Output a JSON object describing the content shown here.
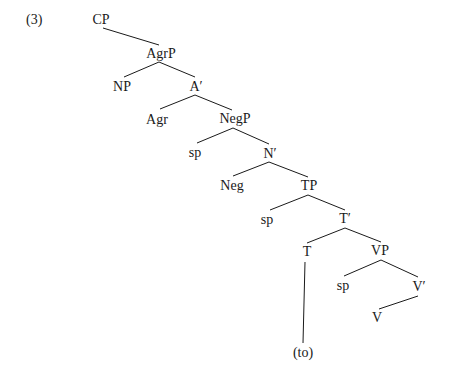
{
  "example_number": "(3)",
  "tree": {
    "nodes": {
      "cp": {
        "label": "CP",
        "x": 101,
        "y": 13
      },
      "agrp": {
        "label": "AgrP",
        "x": 161,
        "y": 47
      },
      "np": {
        "label": "NP",
        "x": 122,
        "y": 80
      },
      "a_bar": {
        "label": "A′",
        "x": 196,
        "y": 80
      },
      "agr": {
        "label": "Agr",
        "x": 157,
        "y": 113
      },
      "negp": {
        "label": "NegP",
        "x": 235,
        "y": 112
      },
      "sp1": {
        "label": "sp",
        "x": 195,
        "y": 146
      },
      "n_bar": {
        "label": "N′",
        "x": 270,
        "y": 147
      },
      "neg": {
        "label": "Neg",
        "x": 232,
        "y": 179
      },
      "tp": {
        "label": "TP",
        "x": 309,
        "y": 179
      },
      "sp2": {
        "label": "sp",
        "x": 267,
        "y": 213
      },
      "t_bar": {
        "label": "T′",
        "x": 345,
        "y": 212
      },
      "t": {
        "label": "T",
        "x": 307,
        "y": 245
      },
      "vp": {
        "label": "VP",
        "x": 380,
        "y": 244
      },
      "sp3": {
        "label": "sp",
        "x": 343,
        "y": 279
      },
      "v_bar": {
        "label": "V′",
        "x": 419,
        "y": 280
      },
      "v": {
        "label": "V",
        "x": 377,
        "y": 311
      },
      "to": {
        "label": "(to)",
        "x": 303,
        "y": 346
      }
    },
    "edges": [
      {
        "from": "CP",
        "to": "AgrP",
        "x1": 103,
        "y1": 28,
        "x2": 159,
        "y2": 45
      },
      {
        "from": "AgrP",
        "to": "NP",
        "x1": 159,
        "y1": 62,
        "x2": 124,
        "y2": 77
      },
      {
        "from": "AgrP",
        "to": "A′",
        "x1": 159,
        "y1": 62,
        "x2": 195,
        "y2": 77
      },
      {
        "from": "A′",
        "to": "Agr",
        "x1": 195,
        "y1": 95,
        "x2": 160,
        "y2": 109
      },
      {
        "from": "A′",
        "to": "NegP",
        "x1": 195,
        "y1": 95,
        "x2": 232,
        "y2": 110
      },
      {
        "from": "NegP",
        "to": "sp",
        "x1": 233,
        "y1": 128,
        "x2": 197,
        "y2": 143
      },
      {
        "from": "NegP",
        "to": "N′",
        "x1": 233,
        "y1": 128,
        "x2": 269,
        "y2": 144
      },
      {
        "from": "N′",
        "to": "Neg",
        "x1": 269,
        "y1": 162,
        "x2": 233,
        "y2": 176
      },
      {
        "from": "N′",
        "to": "TP",
        "x1": 269,
        "y1": 162,
        "x2": 308,
        "y2": 177
      },
      {
        "from": "TP",
        "to": "sp",
        "x1": 308,
        "y1": 195,
        "x2": 270,
        "y2": 210
      },
      {
        "from": "TP",
        "to": "T′",
        "x1": 308,
        "y1": 195,
        "x2": 345,
        "y2": 210
      },
      {
        "from": "T′",
        "to": "T",
        "x1": 345,
        "y1": 228,
        "x2": 307,
        "y2": 243
      },
      {
        "from": "T′",
        "to": "VP",
        "x1": 345,
        "y1": 228,
        "x2": 381,
        "y2": 242
      },
      {
        "from": "VP",
        "to": "sp",
        "x1": 381,
        "y1": 260,
        "x2": 344,
        "y2": 276
      },
      {
        "from": "VP",
        "to": "V′",
        "x1": 381,
        "y1": 260,
        "x2": 418,
        "y2": 277
      },
      {
        "from": "V′",
        "to": "V",
        "x1": 418,
        "y1": 296,
        "x2": 379,
        "y2": 309
      },
      {
        "from": "T",
        "to": "(to)",
        "x1": 305,
        "y1": 262,
        "x2": 303,
        "y2": 343
      }
    ]
  },
  "colors": {
    "ink": "#1a1a1a",
    "background": "#ffffff"
  }
}
